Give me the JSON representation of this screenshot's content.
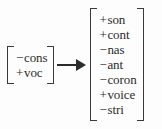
{
  "notation": {
    "type": "phonological-rule",
    "arrow_symbol": "→",
    "arrow_icon_name": "rightwards-arrow-icon",
    "text_color": "#2b2b2b",
    "bracket_color": "#3a3a3a",
    "background_color": "#fdfdfd"
  },
  "source_matrix": {
    "label": "structural-description",
    "features": [
      {
        "sign": "−",
        "name": "cons"
      },
      {
        "sign": "+",
        "name": "voc"
      }
    ]
  },
  "target_matrix": {
    "label": "structural-change",
    "features": [
      {
        "sign": "+",
        "name": "son"
      },
      {
        "sign": "+",
        "name": "cont"
      },
      {
        "sign": "−",
        "name": "nas"
      },
      {
        "sign": "−",
        "name": "ant"
      },
      {
        "sign": "−",
        "name": "coron"
      },
      {
        "sign": "+",
        "name": "voice"
      },
      {
        "sign": "−",
        "name": "stri"
      }
    ]
  }
}
